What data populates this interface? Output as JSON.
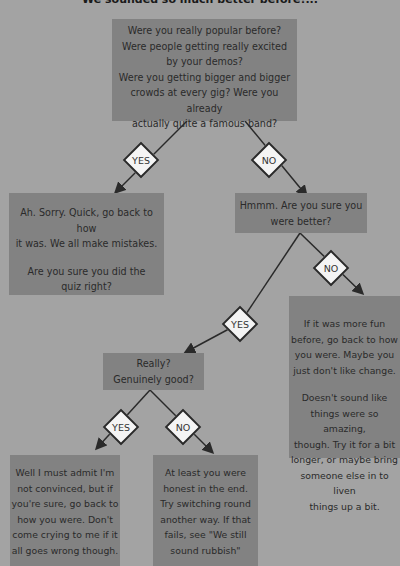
{
  "heading": "We sounded so much better before!...",
  "nodes": {
    "q1": {
      "lines": [
        "Were you really popular before?",
        "Were people getting really excited",
        "by your demos?",
        "Were you getting bigger and bigger",
        "crowds at every gig? Were you already",
        "actually quite a famous band?"
      ]
    },
    "a_sorry": {
      "para1": [
        "Ah. Sorry. Quick, go back to how",
        "it was. We all make mistakes."
      ],
      "para2": [
        "Are you sure you did the",
        "quiz right?"
      ]
    },
    "q2": {
      "lines": [
        "Hmmm. Are you sure you",
        "were better?"
      ]
    },
    "a_fun": {
      "para1": [
        "If it was more fun",
        "before, go back to how",
        "you were. Maybe you",
        "just don't like change."
      ],
      "para2": [
        "Doesn't sound like",
        "things were so amazing,",
        "though. Try it for a bit",
        "longer, or maybe bring",
        "someone else in to liven",
        "things up a bit."
      ]
    },
    "q3": {
      "lines": [
        "Really?",
        "Genuinely good?"
      ]
    },
    "a_convinced": {
      "lines": [
        "Well I must admit I'm",
        "not convinced, but if",
        "you're sure, go back to",
        "how you were. Don't",
        "come crying to me if it",
        "all goes wrong though."
      ]
    },
    "a_honest": {
      "lines": [
        "At least you were",
        "honest in the end.",
        "Try switching round",
        "another way. If that",
        "fails, see \"We still",
        "sound rubbish\""
      ]
    }
  },
  "decisions": {
    "d1_yes": "YES",
    "d1_no": "NO",
    "d2_yes": "YES",
    "d2_no": "NO",
    "d3_yes": "YES",
    "d3_no": "NO"
  },
  "colors": {
    "background": "#a3a3a3",
    "box": "#828282",
    "diamond": "#f4f4f4",
    "line": "#2a2a2a"
  }
}
